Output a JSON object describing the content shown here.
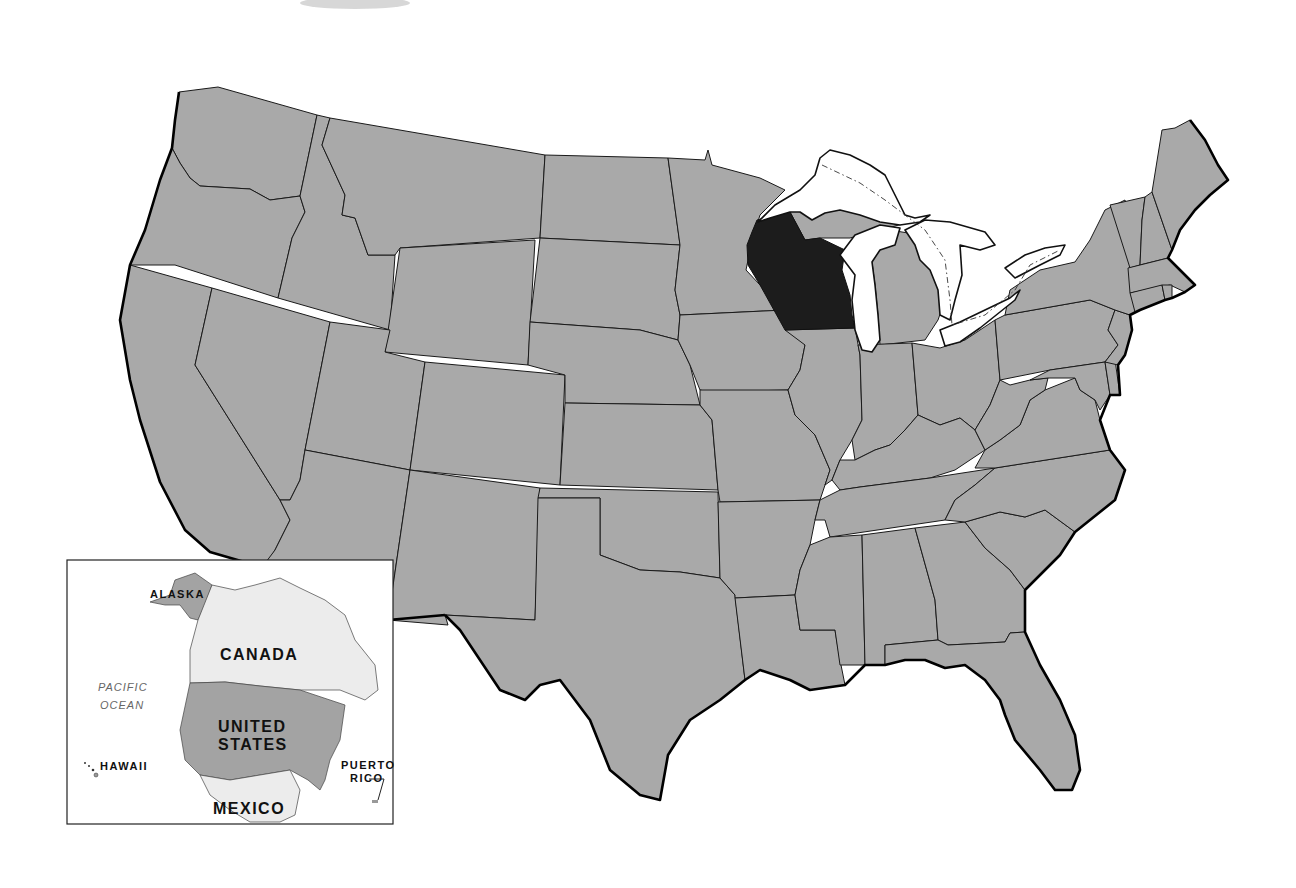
{
  "map": {
    "title": "United States map with Wisconsin highlighted",
    "highlighted_state": "Wisconsin",
    "colors": {
      "state_fill": "#a9a9a9",
      "highlight_fill": "#1c1c1c",
      "water": "#ffffff",
      "border": "#1a1a1a"
    }
  },
  "inset": {
    "labels": {
      "alaska": "ALASKA",
      "canada": "CANADA",
      "pacific_line1": "PACIFIC",
      "pacific_line2": "OCEAN",
      "united_line1": "UNITED",
      "united_line2": "STATES",
      "hawaii": "HAWAII",
      "puerto_line1": "PUERTO",
      "puerto_line2": "RICO",
      "mexico": "MEXICO"
    },
    "colors": {
      "us_fill": "#a3a3a3",
      "neighbor_fill": "#ececec"
    }
  }
}
